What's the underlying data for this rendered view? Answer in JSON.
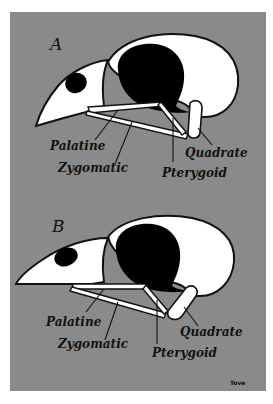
{
  "colors": {
    "background": "#ffffff",
    "panel": "#8a8a8a",
    "bone": "#ffffff",
    "outline": "#111111",
    "orbit": "#000000"
  },
  "panels": [
    {
      "letter": "A",
      "labels": {
        "palatine": "Palatine",
        "zygomatic": "Zygomatic",
        "pterygoid": "Pterygoid",
        "quadrate": "Quadrate"
      }
    },
    {
      "letter": "B",
      "labels": {
        "palatine": "Palatine",
        "zygomatic": "Zygomatic",
        "pterygoid": "Pterygoid",
        "quadrate": "Quadrate"
      }
    }
  ],
  "signature": "Tove"
}
